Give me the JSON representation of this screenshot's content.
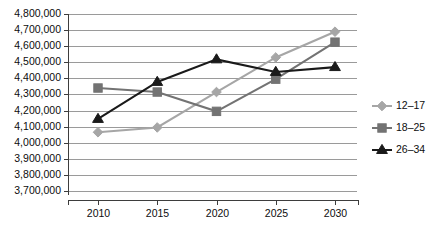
{
  "chart_data": {
    "type": "line",
    "title": "",
    "xlabel": "",
    "ylabel": "",
    "categories": [
      "2010",
      "2015",
      "2020",
      "2025",
      "2030"
    ],
    "x": [
      2010,
      2015,
      2020,
      2025,
      2030
    ],
    "ylim": [
      3700000,
      4800000
    ],
    "ytick_step": 100000,
    "ytick_labels": [
      "4,800,000",
      "4,700,000",
      "4,600,000",
      "4,500,000",
      "4,400,000",
      "4,300,000",
      "4,200,000",
      "4,100,000",
      "4,000,000",
      "3,900,000",
      "3,800,000",
      "3,700,000"
    ],
    "ytick_values": [
      4800000,
      4700000,
      4600000,
      4500000,
      4400000,
      4300000,
      4200000,
      4100000,
      4000000,
      3900000,
      3800000,
      3700000
    ],
    "grid": true,
    "legend_position": "right",
    "series": [
      {
        "name": "12–17",
        "color": "#a6a6a6",
        "marker": "diamond",
        "values": [
          4065000,
          4095000,
          4315000,
          4530000,
          4690000
        ]
      },
      {
        "name": "18–25",
        "color": "#737373",
        "marker": "square",
        "values": [
          4340000,
          4315000,
          4195000,
          4395000,
          4625000
        ]
      },
      {
        "name": "26–34",
        "color": "#1a1a1a",
        "marker": "triangle",
        "values": [
          4148000,
          4378000,
          4518000,
          4440000,
          4470000
        ]
      }
    ]
  },
  "legend": {
    "entries": [
      {
        "label": "12–17",
        "icon": "diamond-marker-icon"
      },
      {
        "label": "18–25",
        "icon": "square-marker-icon"
      },
      {
        "label": "26–34",
        "icon": "triangle-marker-icon"
      }
    ]
  },
  "colors": {
    "background": "#ffffff",
    "gridline": "#9a9a9a",
    "axis": "#3d3d3d",
    "text": "#0d0d0d",
    "series_12_17": "#a6a6a6",
    "series_18_25": "#737373",
    "series_26_34": "#1a1a1a"
  }
}
